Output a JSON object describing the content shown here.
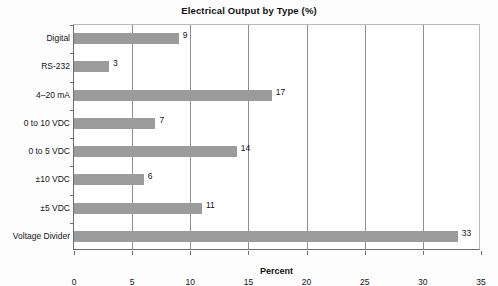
{
  "chart_data": {
    "type": "bar",
    "orientation": "horizontal",
    "title": "Electrical Output by Type (%)",
    "xlabel": "Percent",
    "ylabel": "",
    "xlim": [
      0,
      35
    ],
    "xticks": [
      0,
      5,
      10,
      15,
      20,
      25,
      30,
      35
    ],
    "xtick_labels": [
      "0",
      "5",
      "10",
      "15",
      "20",
      "25",
      "30",
      "35"
    ],
    "grid": "vertical",
    "legend": "none",
    "bar_color": "#9b9b9b",
    "categories": [
      "Digital",
      "RS-232",
      "4–20 mA",
      "0 to 10 VDC",
      "0 to 5 VDC",
      "±10 VDC",
      "±5 VDC",
      "Voltage Divider"
    ],
    "values": [
      9,
      3,
      17,
      7,
      14,
      6,
      11,
      33
    ],
    "data_labels": [
      "9",
      "3",
      "17",
      "7",
      "14",
      "6",
      "11",
      "33"
    ],
    "points": [
      {
        "category": "Digital",
        "value": 9,
        "label": "9"
      },
      {
        "category": "RS-232",
        "value": 3,
        "label": "3"
      },
      {
        "category": "4–20 mA",
        "value": 17,
        "label": "17"
      },
      {
        "category": "0 to 10 VDC",
        "value": 7,
        "label": "7"
      },
      {
        "category": "0 to 5 VDC",
        "value": 14,
        "label": "14"
      },
      {
        "category": "±10 VDC",
        "value": 6,
        "label": "6"
      },
      {
        "category": "±5 VDC",
        "value": 11,
        "label": "11"
      },
      {
        "category": "Voltage Divider",
        "value": 33,
        "label": "33"
      }
    ]
  }
}
